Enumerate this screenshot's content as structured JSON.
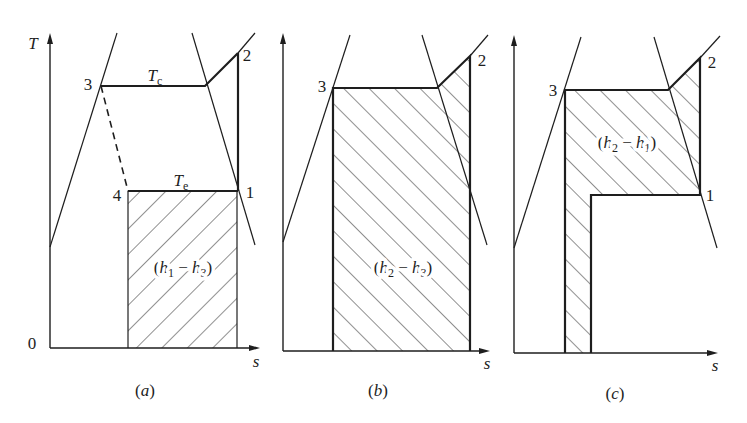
{
  "diagram": {
    "type": "T-s diagrams (vapour-compression refrigeration cycle)",
    "colors": {
      "ink": "#1e1e1e",
      "background": "#ffffff",
      "hatch": "#333333"
    },
    "panels": [
      {
        "id": "a",
        "axes": {
          "x0": 50,
          "y0": 348,
          "yTop": 33,
          "xRight": 260
        },
        "hatch": {
          "name": "refrigerating-effect-area",
          "dir": "fwd",
          "points": [
            [
              128,
              191
            ],
            [
              237,
              191
            ],
            [
              237,
              348
            ],
            [
              128,
              348
            ]
          ]
        },
        "lines": [
          {
            "name": "saturated-liquid-line",
            "kind": "thin",
            "points": [
              [
                50,
                247
              ],
              [
                117,
                33
              ]
            ]
          },
          {
            "name": "saturated-vapor-line",
            "kind": "thin",
            "points": [
              [
                192,
                33
              ],
              [
                255,
                245
              ]
            ]
          },
          {
            "name": "superheat-extension-line",
            "kind": "thin",
            "points": [
              [
                238,
                53
              ],
              [
                255,
                33
              ]
            ]
          },
          {
            "name": "condensation-line",
            "kind": "thick",
            "points": [
              [
                101,
                86
              ],
              [
                205,
                86
              ],
              [
                238,
                53
              ]
            ]
          },
          {
            "name": "compression-line",
            "kind": "thick",
            "points": [
              [
                238,
                53
              ],
              [
                238,
                191
              ]
            ]
          },
          {
            "name": "throttling-line",
            "kind": "dashed",
            "points": [
              [
                101,
                86
              ],
              [
                128,
                191
              ]
            ]
          },
          {
            "name": "evaporation-line",
            "kind": "thick",
            "points": [
              [
                128,
                191
              ],
              [
                238,
                191
              ]
            ]
          },
          {
            "name": "area-left-edge",
            "kind": "thin",
            "points": [
              [
                128,
                191
              ],
              [
                128,
                348
              ]
            ]
          },
          {
            "name": "area-right-edge",
            "kind": "thin",
            "points": [
              [
                237,
                191
              ],
              [
                237,
                348
              ]
            ]
          }
        ],
        "labels": [
          {
            "name": "temperature-axis-label",
            "x": 33,
            "y": 49,
            "runs": [
              {
                "t": "T",
                "i": true
              }
            ]
          },
          {
            "name": "origin-label",
            "x": 32,
            "y": 349,
            "runs": [
              {
                "t": "0"
              }
            ]
          },
          {
            "name": "entropy-axis-label",
            "x": 256,
            "y": 367,
            "runs": [
              {
                "t": "s",
                "i": true
              }
            ]
          },
          {
            "name": "state-3-label",
            "x": 88,
            "y": 90,
            "runs": [
              {
                "t": "3"
              }
            ]
          },
          {
            "name": "state-2-label",
            "x": 247,
            "y": 61,
            "runs": [
              {
                "t": "2"
              }
            ]
          },
          {
            "name": "state-1-label",
            "x": 250,
            "y": 198,
            "runs": [
              {
                "t": "1"
              }
            ]
          },
          {
            "name": "state-4-label",
            "x": 117,
            "y": 201,
            "runs": [
              {
                "t": "4"
              }
            ]
          },
          {
            "name": "condensing-temperature-label",
            "x": 155,
            "y": 81,
            "text": "Tc",
            "runs": [
              {
                "t": "T",
                "i": true
              },
              {
                "t": "c",
                "sub": true
              }
            ]
          },
          {
            "name": "evaporating-temperature-label",
            "x": 181,
            "y": 186,
            "text": "Te",
            "runs": [
              {
                "t": "T",
                "i": true
              },
              {
                "t": "e",
                "sub": true
              }
            ]
          },
          {
            "name": "area-label",
            "x": 183,
            "y": 273,
            "halo": true,
            "text": "(h1 − h3)",
            "runs": [
              {
                "t": "("
              },
              {
                "t": "h",
                "i": true
              },
              {
                "t": "1",
                "sub": true
              },
              {
                "t": " − "
              },
              {
                "t": "h",
                "i": true
              },
              {
                "t": "3",
                "sub": true
              },
              {
                "t": ")"
              }
            ]
          },
          {
            "name": "panel-caption",
            "x": 145,
            "y": 396,
            "text": "(a)",
            "runs": [
              {
                "t": "("
              },
              {
                "t": "a",
                "i": true
              },
              {
                "t": ")"
              }
            ]
          }
        ]
      },
      {
        "id": "b",
        "axes": {
          "x0": 283,
          "y0": 351,
          "yTop": 33,
          "xRight": 490
        },
        "hatch": {
          "name": "condenser-heat-area",
          "dir": "back",
          "points": [
            [
              333,
              88
            ],
            [
              437,
              88
            ],
            [
              470,
              56
            ],
            [
              470,
              351
            ],
            [
              333,
              351
            ]
          ]
        },
        "lines": [
          {
            "name": "saturated-liquid-line",
            "kind": "thin",
            "points": [
              [
                283,
                242
              ],
              [
                350,
                35
              ]
            ]
          },
          {
            "name": "saturated-vapor-line",
            "kind": "thin",
            "points": [
              [
                422,
                35
              ],
              [
                487,
                245
              ]
            ]
          },
          {
            "name": "superheat-extension-line",
            "kind": "thin",
            "points": [
              [
                470,
                56
              ],
              [
                488,
                35
              ]
            ]
          },
          {
            "name": "area-boundary",
            "kind": "thick",
            "points": [
              [
                333,
                351
              ],
              [
                333,
                88
              ],
              [
                437,
                88
              ],
              [
                470,
                56
              ],
              [
                470,
                351
              ]
            ]
          }
        ],
        "labels": [
          {
            "name": "entropy-axis-label",
            "x": 487,
            "y": 369,
            "runs": [
              {
                "t": "s",
                "i": true
              }
            ]
          },
          {
            "name": "state-3-label",
            "x": 322,
            "y": 92,
            "runs": [
              {
                "t": "3"
              }
            ]
          },
          {
            "name": "state-2-label",
            "x": 482,
            "y": 66,
            "runs": [
              {
                "t": "2"
              }
            ]
          },
          {
            "name": "area-label",
            "x": 403,
            "y": 273,
            "halo": true,
            "text": "(h2 − h3)",
            "runs": [
              {
                "t": "("
              },
              {
                "t": "h",
                "i": true
              },
              {
                "t": "2",
                "sub": true
              },
              {
                "t": " − "
              },
              {
                "t": "h",
                "i": true
              },
              {
                "t": "3",
                "sub": true
              },
              {
                "t": ")"
              }
            ]
          },
          {
            "name": "panel-caption",
            "x": 378,
            "y": 396,
            "text": "(b)",
            "runs": [
              {
                "t": "("
              },
              {
                "t": "b",
                "i": true
              },
              {
                "t": ")"
              }
            ]
          }
        ]
      },
      {
        "id": "c",
        "axes": {
          "x0": 514,
          "y0": 353,
          "yTop": 35,
          "xRight": 718
        },
        "hatch": {
          "name": "compressor-work-area",
          "dir": "back",
          "points": [
            [
              565,
              90
            ],
            [
              668,
              90
            ],
            [
              700,
              58
            ],
            [
              700,
              195
            ],
            [
              591,
              195
            ],
            [
              591,
              353
            ],
            [
              565,
              353
            ]
          ]
        },
        "lines": [
          {
            "name": "saturated-liquid-line",
            "kind": "thin",
            "points": [
              [
                514,
                248
              ],
              [
                581,
                37
              ]
            ]
          },
          {
            "name": "saturated-vapor-line",
            "kind": "thin",
            "points": [
              [
                654,
                37
              ],
              [
                717,
                248
              ]
            ]
          },
          {
            "name": "superheat-extension-line",
            "kind": "thin",
            "points": [
              [
                700,
                58
              ],
              [
                720,
                36
              ]
            ]
          },
          {
            "name": "area-boundary",
            "kind": "thick",
            "points": [
              [
                565,
                353
              ],
              [
                565,
                90
              ],
              [
                668,
                90
              ],
              [
                700,
                58
              ],
              [
                700,
                195
              ],
              [
                591,
                195
              ],
              [
                591,
                353
              ]
            ]
          }
        ],
        "labels": [
          {
            "name": "entropy-axis-label",
            "x": 715,
            "y": 371,
            "runs": [
              {
                "t": "s",
                "i": true
              }
            ]
          },
          {
            "name": "state-3-label",
            "x": 553,
            "y": 96,
            "runs": [
              {
                "t": "3"
              }
            ]
          },
          {
            "name": "state-2-label",
            "x": 712,
            "y": 68,
            "runs": [
              {
                "t": "2"
              }
            ]
          },
          {
            "name": "state-1-label",
            "x": 710,
            "y": 201,
            "runs": [
              {
                "t": "1"
              }
            ]
          },
          {
            "name": "area-label",
            "x": 627,
            "y": 148,
            "halo": true,
            "text": "(h2 − h1)",
            "runs": [
              {
                "t": "("
              },
              {
                "t": "h",
                "i": true
              },
              {
                "t": "2",
                "sub": true
              },
              {
                "t": " − "
              },
              {
                "t": "h",
                "i": true
              },
              {
                "t": "1",
                "sub": true
              },
              {
                "t": ")"
              }
            ]
          },
          {
            "name": "panel-caption",
            "x": 615,
            "y": 399,
            "text": "(c)",
            "runs": [
              {
                "t": "("
              },
              {
                "t": "c",
                "i": true
              },
              {
                "t": ")"
              }
            ]
          }
        ]
      }
    ]
  }
}
